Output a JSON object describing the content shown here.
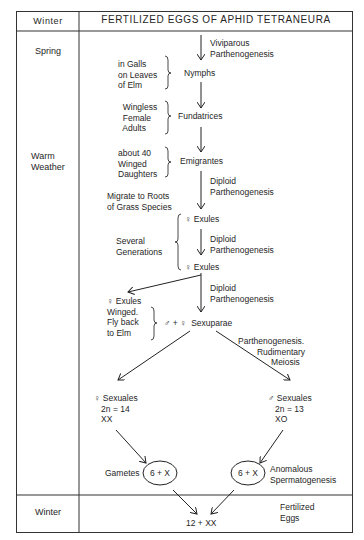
{
  "header": {
    "season": "Winter",
    "title": "FERTILIZED EGGS OF APHID TETRANEURA"
  },
  "seasons": {
    "spring": "Spring",
    "warm": "Warm\nWeather",
    "winter_bottom": "Winter"
  },
  "stages": {
    "nymphs": "Nymphs",
    "fundatrices": "Fundatrices",
    "emigrantes": "Emigrantes",
    "exules_1": "♀ Exules",
    "exules_2": "♀ Exules",
    "sexuparae": "♂ + ♀  Sexuparae",
    "female_sexuales": "♀ Sexuales\n   2n = 14\n   XX",
    "male_sexuales": "♂ Sexuales\n   2n = 13\n   XO",
    "gamete_female": "6 + X",
    "gamete_male": "6 + X",
    "zygote": "12 + XX"
  },
  "process_labels": {
    "viviparous": "Viviparous\nParthenogenesis",
    "diploid_1": "Diploid\nParthenogenesis",
    "diploid_2": "Diploid\nParthenogenesis",
    "diploid_3": "Diploid\nParthenogenesis",
    "rudimentary": "Parthenogenesis.\n        Rudimentary\n              Meiosis",
    "anomalous": "Anomalous\nSpermatogenesis"
  },
  "annotations": {
    "galls": "in Galls\non Leaves\nof Elm",
    "wingless": "  Wingless\n  Female\n  Adults",
    "winged_daughters": "about 40\nWinged\nDaughters",
    "migrate": "Migrate to Roots\nof Grass Species",
    "several": "Several\nGenerations",
    "exules_winged": "♀ Exules\nWinged.\nFly back\nto Elm",
    "gametes": "Gametes",
    "fertilized": "Fertilized\nEggs"
  }
}
